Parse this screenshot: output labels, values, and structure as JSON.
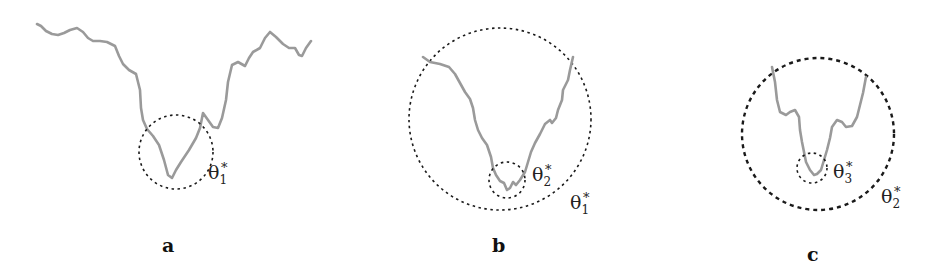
{
  "figure": {
    "panels": [
      {
        "id": "a",
        "label": "a",
        "annotations": [
          {
            "symbol": "θ",
            "subscript": "1",
            "superscript": "*"
          }
        ]
      },
      {
        "id": "b",
        "label": "b",
        "annotations": [
          {
            "symbol": "θ",
            "subscript": "2",
            "superscript": "*"
          },
          {
            "symbol": "θ",
            "subscript": "1",
            "superscript": "*"
          }
        ]
      },
      {
        "id": "c",
        "label": "c",
        "annotations": [
          {
            "symbol": "θ",
            "subscript": "3",
            "superscript": "*"
          },
          {
            "symbol": "θ",
            "subscript": "2",
            "superscript": "*"
          }
        ]
      }
    ],
    "colors": {
      "curve": "#9a9a9a",
      "circle": "#1a1a1a",
      "background": "#ffffff"
    }
  }
}
